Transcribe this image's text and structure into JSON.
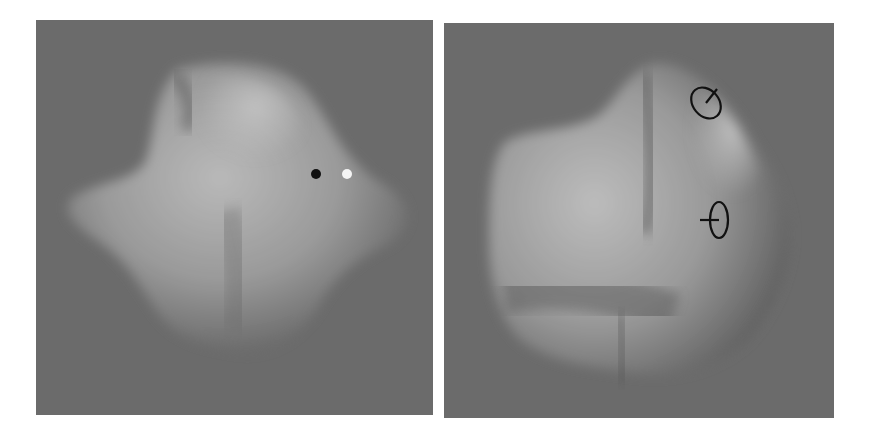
{
  "figure": {
    "panels": [
      {
        "id": "left",
        "description": "Rendered smooth blob-like 3D object with two dot probes",
        "background_color": "#6b6b6b",
        "markers": [
          {
            "type": "dot",
            "color": "#111111",
            "position": [
              316,
              174
            ]
          },
          {
            "type": "dot",
            "color": "#f4f4f4",
            "position": [
              347,
              174
            ]
          }
        ]
      },
      {
        "id": "right",
        "description": "Rendered smooth blob-like 3D object with two gauge-figure probes",
        "background_color": "#6b6b6b",
        "markers": [
          {
            "type": "gauge-figure",
            "color": "#111111",
            "position": [
              706,
              104
            ]
          },
          {
            "type": "gauge-figure",
            "color": "#111111",
            "position": [
              716,
              219
            ]
          }
        ]
      }
    ]
  }
}
